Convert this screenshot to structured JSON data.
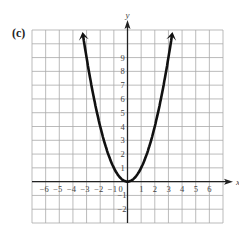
{
  "panel_label": "(c)",
  "chart_data": {
    "type": "line",
    "title": "",
    "panel": "(c)",
    "xlabel": "x",
    "ylabel": "y",
    "xlim": [
      -7,
      7
    ],
    "ylim": [
      -3,
      11
    ],
    "grid": true,
    "x_ticks": [
      "-6",
      "-5",
      "-4",
      "-3",
      "-2",
      "-1",
      "0",
      "1",
      "2",
      "3",
      "4",
      "5",
      "6"
    ],
    "y_ticks": [
      "-2",
      "-1",
      "1",
      "2",
      "3",
      "4",
      "5",
      "6",
      "7",
      "8",
      "9"
    ],
    "series": [
      {
        "name": "y = x^2",
        "x": [
          -3.3,
          -3,
          -2.5,
          -2,
          -1.5,
          -1,
          -0.5,
          0,
          0.5,
          1,
          1.5,
          2,
          2.5,
          3,
          3.3
        ],
        "y": [
          10.9,
          9,
          6.25,
          4,
          2.25,
          1,
          0.25,
          0,
          0.25,
          1,
          2.25,
          4,
          6.25,
          9,
          10.9
        ],
        "arrows_at_ends": true
      }
    ],
    "legend": null
  }
}
